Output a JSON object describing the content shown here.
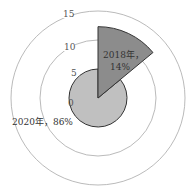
{
  "chart_data": {
    "type": "polar-area",
    "title": "",
    "categories": [
      "2018年",
      "2020年"
    ],
    "series": [
      {
        "name": "2018年",
        "share_pct": 14,
        "radius_value": 12.3,
        "label": "2018年，14%",
        "color": "#8c8c8c"
      },
      {
        "name": "2020年",
        "share_pct": 86,
        "radius_value": 5,
        "label": "2020年，86%",
        "color": "#c0c0c0"
      }
    ],
    "radial_ticks": [
      "0",
      "5",
      "10",
      "15"
    ],
    "rlim": [
      0,
      15
    ],
    "grid": true,
    "legend": "none"
  }
}
